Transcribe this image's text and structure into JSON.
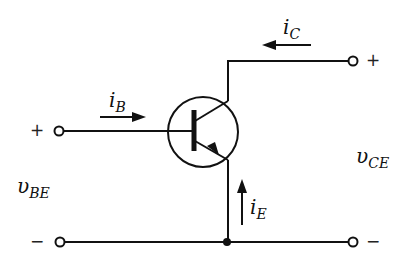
{
  "diagram": {
    "type": "circuit",
    "colors": {
      "stroke": "#111111",
      "background": "#ffffff"
    },
    "components": [
      {
        "id": "Q1",
        "kind": "npn-transistor",
        "terminals": [
          "base",
          "collector",
          "emitter"
        ]
      }
    ],
    "currents": {
      "base": {
        "symbol": "i",
        "sub": "B",
        "direction": "into base (left to right)"
      },
      "collector": {
        "symbol": "i",
        "sub": "C",
        "direction": "into collector (right to left)"
      },
      "emitter": {
        "symbol": "i",
        "sub": "E",
        "direction": "upward toward emitter"
      }
    },
    "voltages": {
      "vBE": {
        "symbol": "υ",
        "sub": "BE",
        "plus": "+",
        "minus": "−"
      },
      "vCE": {
        "symbol": "υ",
        "sub": "CE",
        "plus": "+",
        "minus": "−"
      }
    },
    "terminals": [
      {
        "id": "base-in",
        "sign": "+"
      },
      {
        "id": "collector-out",
        "sign": "+"
      },
      {
        "id": "ground-left",
        "sign": "−"
      },
      {
        "id": "ground-right",
        "sign": "−"
      }
    ]
  }
}
